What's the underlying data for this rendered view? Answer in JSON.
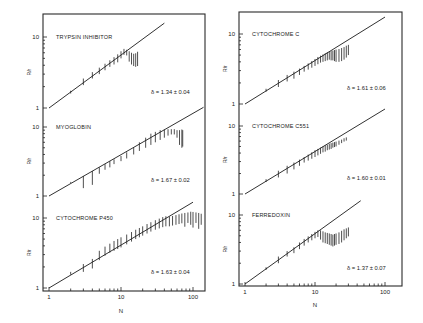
{
  "figure": {
    "x_axis_label": "N",
    "y_axis_label": "R/r",
    "x_tick_labels": [
      "1",
      "10",
      "100"
    ],
    "y_tick_labels": [
      "1",
      "10"
    ]
  },
  "chart_data": [
    {
      "type": "scatter",
      "title": "TRYPSIN INHIBITOR",
      "annotation": "δ = 1.34 ± 0.04",
      "delta": 1.34,
      "delta_err": 0.04,
      "xlabel": "N",
      "ylabel": "R/r",
      "xscale": "log",
      "yscale": "log",
      "xlim": [
        1,
        150
      ],
      "ylim": [
        1,
        20
      ],
      "fit_line": {
        "slope_exponent": 0.746,
        "x_range": [
          1,
          40
        ]
      },
      "error_bars": [
        {
          "n": 2,
          "lo": 1.6,
          "hi": 1.75
        },
        {
          "n": 3,
          "lo": 2.1,
          "hi": 2.6
        },
        {
          "n": 4,
          "lo": 2.6,
          "hi": 3.2
        },
        {
          "n": 5,
          "lo": 3.0,
          "hi": 3.7
        },
        {
          "n": 6,
          "lo": 3.4,
          "hi": 4.2
        },
        {
          "n": 7,
          "lo": 3.8,
          "hi": 4.7
        },
        {
          "n": 8,
          "lo": 4.1,
          "hi": 5.2
        },
        {
          "n": 9,
          "lo": 4.4,
          "hi": 5.7
        },
        {
          "n": 10,
          "lo": 5.0,
          "hi": 6.3
        },
        {
          "n": 11,
          "lo": 5.6,
          "hi": 6.8
        },
        {
          "n": 12,
          "lo": 5.5,
          "hi": 6.6
        },
        {
          "n": 13,
          "lo": 4.5,
          "hi": 6.3
        },
        {
          "n": 14,
          "lo": 4.1,
          "hi": 6.0
        },
        {
          "n": 15,
          "lo": 3.9,
          "hi": 5.8
        },
        {
          "n": 16,
          "lo": 3.8,
          "hi": 5.9
        },
        {
          "n": 17,
          "lo": 3.9,
          "hi": 6.2
        }
      ]
    },
    {
      "type": "scatter",
      "title": "MYOGLOBIN",
      "annotation": "δ = 1.67 ± 0.02",
      "delta": 1.67,
      "delta_err": 0.02,
      "xlabel": "N",
      "ylabel": "R/r",
      "xscale": "log",
      "yscale": "log",
      "xlim": [
        1,
        150
      ],
      "ylim": [
        1,
        20
      ],
      "fit_line": {
        "slope_exponent": 0.599,
        "x_range": [
          1,
          140
        ]
      },
      "error_bars": [
        {
          "n": 2,
          "lo": 1.55,
          "hi": 1.6
        },
        {
          "n": 3,
          "lo": 1.3,
          "hi": 1.95
        },
        {
          "n": 4,
          "lo": 1.45,
          "hi": 2.3
        },
        {
          "n": 5,
          "lo": 2.1,
          "hi": 2.6
        },
        {
          "n": 6,
          "lo": 2.4,
          "hi": 2.9
        },
        {
          "n": 7,
          "lo": 2.6,
          "hi": 3.2
        },
        {
          "n": 8,
          "lo": 2.9,
          "hi": 3.4
        },
        {
          "n": 10,
          "lo": 3.2,
          "hi": 3.8
        },
        {
          "n": 12,
          "lo": 3.5,
          "hi": 4.3
        },
        {
          "n": 15,
          "lo": 4.0,
          "hi": 5.0
        },
        {
          "n": 18,
          "lo": 4.5,
          "hi": 6.0
        },
        {
          "n": 22,
          "lo": 5.0,
          "hi": 7.0
        },
        {
          "n": 26,
          "lo": 5.5,
          "hi": 8.0
        },
        {
          "n": 30,
          "lo": 6.0,
          "hi": 8.5
        },
        {
          "n": 35,
          "lo": 6.5,
          "hi": 9.0
        },
        {
          "n": 40,
          "lo": 7.0,
          "hi": 9.2
        },
        {
          "n": 45,
          "lo": 7.5,
          "hi": 9.3
        },
        {
          "n": 50,
          "lo": 7.8,
          "hi": 9.3
        },
        {
          "n": 55,
          "lo": 7.8,
          "hi": 9.3
        },
        {
          "n": 60,
          "lo": 7.0,
          "hi": 9.0
        },
        {
          "n": 65,
          "lo": 5.5,
          "hi": 9.0
        },
        {
          "n": 70,
          "lo": 5.0,
          "hi": 9.2
        },
        {
          "n": 72,
          "lo": 5.2,
          "hi": 9.0
        }
      ]
    },
    {
      "type": "scatter",
      "title": "CYTOCHROME P450",
      "annotation": "δ = 1.63 ± 0.04",
      "delta": 1.63,
      "delta_err": 0.04,
      "xlabel": "N",
      "ylabel": "R/r",
      "xscale": "log",
      "yscale": "log",
      "xlim": [
        1,
        150
      ],
      "ylim": [
        1,
        20
      ],
      "fit_line": {
        "slope_exponent": 0.613,
        "x_range": [
          1,
          100
        ]
      },
      "error_bars": [
        {
          "n": 2,
          "lo": 1.55,
          "hi": 1.7
        },
        {
          "n": 3,
          "lo": 1.7,
          "hi": 2.2
        },
        {
          "n": 4,
          "lo": 1.9,
          "hi": 2.6
        },
        {
          "n": 5,
          "lo": 2.5,
          "hi": 3.4
        },
        {
          "n": 6,
          "lo": 2.9,
          "hi": 3.9
        },
        {
          "n": 7,
          "lo": 3.2,
          "hi": 4.3
        },
        {
          "n": 8,
          "lo": 3.4,
          "hi": 4.7
        },
        {
          "n": 9,
          "lo": 3.6,
          "hi": 5.0
        },
        {
          "n": 10,
          "lo": 3.8,
          "hi": 5.3
        },
        {
          "n": 12,
          "lo": 4.2,
          "hi": 5.8
        },
        {
          "n": 14,
          "lo": 4.6,
          "hi": 6.3
        },
        {
          "n": 16,
          "lo": 5.0,
          "hi": 6.8
        },
        {
          "n": 18,
          "lo": 5.3,
          "hi": 7.2
        },
        {
          "n": 20,
          "lo": 5.6,
          "hi": 7.6
        },
        {
          "n": 23,
          "lo": 6.0,
          "hi": 8.2
        },
        {
          "n": 26,
          "lo": 6.4,
          "hi": 8.7
        },
        {
          "n": 30,
          "lo": 6.8,
          "hi": 9.3
        },
        {
          "n": 34,
          "lo": 7.1,
          "hi": 9.8
        },
        {
          "n": 38,
          "lo": 7.4,
          "hi": 10.3
        },
        {
          "n": 42,
          "lo": 7.6,
          "hi": 10.6
        },
        {
          "n": 47,
          "lo": 7.6,
          "hi": 10.5
        },
        {
          "n": 52,
          "lo": 7.8,
          "hi": 10.7
        },
        {
          "n": 58,
          "lo": 8.0,
          "hi": 11.0
        },
        {
          "n": 64,
          "lo": 8.2,
          "hi": 11.3
        },
        {
          "n": 70,
          "lo": 8.4,
          "hi": 11.6
        },
        {
          "n": 77,
          "lo": 7.5,
          "hi": 11.8
        },
        {
          "n": 85,
          "lo": 8.5,
          "hi": 12.0
        },
        {
          "n": 93,
          "lo": 8.0,
          "hi": 12.3
        },
        {
          "n": 100,
          "lo": 7.3,
          "hi": 12.2
        },
        {
          "n": 110,
          "lo": 8.5,
          "hi": 12.0
        },
        {
          "n": 120,
          "lo": 7.0,
          "hi": 11.8
        },
        {
          "n": 130,
          "lo": 8.0,
          "hi": 11.5
        }
      ]
    },
    {
      "type": "scatter",
      "title": "CYTOCHROME C",
      "annotation": "δ = 1.61 ± 0.06",
      "delta": 1.61,
      "delta_err": 0.06,
      "xlabel": "N",
      "ylabel": "R/r",
      "xscale": "log",
      "yscale": "log",
      "xlim": [
        1,
        150
      ],
      "ylim": [
        1,
        20
      ],
      "fit_line": {
        "slope_exponent": 0.621,
        "x_range": [
          1,
          100
        ]
      },
      "error_bars": [
        {
          "n": 2,
          "lo": 1.5,
          "hi": 1.65
        },
        {
          "n": 3,
          "lo": 1.75,
          "hi": 2.2
        },
        {
          "n": 4,
          "lo": 2.1,
          "hi": 2.6
        },
        {
          "n": 5,
          "lo": 2.3,
          "hi": 2.9
        },
        {
          "n": 6,
          "lo": 2.6,
          "hi": 3.2
        },
        {
          "n": 7,
          "lo": 2.9,
          "hi": 3.5
        },
        {
          "n": 8,
          "lo": 3.1,
          "hi": 3.8
        },
        {
          "n": 9,
          "lo": 3.3,
          "hi": 4.1
        },
        {
          "n": 10,
          "lo": 3.5,
          "hi": 4.4
        },
        {
          "n": 11,
          "lo": 3.7,
          "hi": 4.7
        },
        {
          "n": 12,
          "lo": 3.9,
          "hi": 4.9
        },
        {
          "n": 13,
          "lo": 4.0,
          "hi": 5.1
        },
        {
          "n": 14,
          "lo": 4.1,
          "hi": 5.3
        },
        {
          "n": 15,
          "lo": 4.2,
          "hi": 5.5
        },
        {
          "n": 16,
          "lo": 4.3,
          "hi": 5.6
        },
        {
          "n": 17,
          "lo": 4.2,
          "hi": 5.7
        },
        {
          "n": 18,
          "lo": 4.2,
          "hi": 5.8
        },
        {
          "n": 19,
          "lo": 4.1,
          "hi": 5.9
        },
        {
          "n": 20,
          "lo": 4.0,
          "hi": 6.0
        },
        {
          "n": 22,
          "lo": 4.0,
          "hi": 6.1
        },
        {
          "n": 24,
          "lo": 4.1,
          "hi": 6.3
        },
        {
          "n": 26,
          "lo": 4.3,
          "hi": 6.5
        },
        {
          "n": 28,
          "lo": 4.6,
          "hi": 6.8
        },
        {
          "n": 30,
          "lo": 5.0,
          "hi": 7.0
        }
      ]
    },
    {
      "type": "scatter",
      "title": "CYTOCHROME C551",
      "annotation": "δ = 1.60 ± 0.01",
      "delta": 1.6,
      "delta_err": 0.01,
      "xlabel": "N",
      "ylabel": "R/r",
      "xscale": "log",
      "yscale": "log",
      "xlim": [
        1,
        150
      ],
      "ylim": [
        1,
        20
      ],
      "fit_line": {
        "slope_exponent": 0.625,
        "x_range": [
          1,
          100
        ]
      },
      "error_bars": [
        {
          "n": 2,
          "lo": 1.5,
          "hi": 1.65
        },
        {
          "n": 3,
          "lo": 1.75,
          "hi": 2.2
        },
        {
          "n": 4,
          "lo": 2.0,
          "hi": 2.6
        },
        {
          "n": 5,
          "lo": 2.3,
          "hi": 2.9
        },
        {
          "n": 6,
          "lo": 2.6,
          "hi": 3.2
        },
        {
          "n": 7,
          "lo": 2.9,
          "hi": 3.5
        },
        {
          "n": 8,
          "lo": 3.1,
          "hi": 3.8
        },
        {
          "n": 9,
          "lo": 3.3,
          "hi": 4.1
        },
        {
          "n": 10,
          "lo": 3.5,
          "hi": 4.4
        },
        {
          "n": 11,
          "lo": 3.7,
          "hi": 4.6
        },
        {
          "n": 12,
          "lo": 3.9,
          "hi": 4.8
        },
        {
          "n": 13,
          "lo": 4.1,
          "hi": 5.0
        },
        {
          "n": 14,
          "lo": 4.2,
          "hi": 5.2
        },
        {
          "n": 15,
          "lo": 4.4,
          "hi": 5.3
        },
        {
          "n": 16,
          "lo": 4.5,
          "hi": 5.5
        },
        {
          "n": 17,
          "lo": 4.6,
          "hi": 5.6
        },
        {
          "n": 18,
          "lo": 4.8,
          "hi": 5.7
        },
        {
          "n": 19,
          "lo": 4.9,
          "hi": 5.8
        },
        {
          "n": 20,
          "lo": 5.0,
          "hi": 5.9
        },
        {
          "n": 22,
          "lo": 5.3,
          "hi": 6.1
        },
        {
          "n": 24,
          "lo": 5.6,
          "hi": 6.3
        },
        {
          "n": 26,
          "lo": 5.9,
          "hi": 6.6
        },
        {
          "n": 28,
          "lo": 6.1,
          "hi": 6.8
        }
      ]
    },
    {
      "type": "scatter",
      "title": "FERREDOXIN",
      "annotation": "δ = 1.37 ± 0.07",
      "delta": 1.37,
      "delta_err": 0.07,
      "xlabel": "N",
      "ylabel": "R/r",
      "xscale": "log",
      "yscale": "log",
      "xlim": [
        1,
        150
      ],
      "ylim": [
        1,
        20
      ],
      "fit_line": {
        "slope_exponent": 0.73,
        "x_range": [
          1,
          45
        ]
      },
      "error_bars": [
        {
          "n": 2,
          "lo": 1.6,
          "hi": 1.75
        },
        {
          "n": 3,
          "lo": 2.0,
          "hi": 2.5
        },
        {
          "n": 4,
          "lo": 2.5,
          "hi": 3.0
        },
        {
          "n": 5,
          "lo": 2.8,
          "hi": 3.4
        },
        {
          "n": 6,
          "lo": 3.2,
          "hi": 4.0
        },
        {
          "n": 7,
          "lo": 3.6,
          "hi": 4.5
        },
        {
          "n": 8,
          "lo": 4.0,
          "hi": 4.9
        },
        {
          "n": 9,
          "lo": 4.3,
          "hi": 5.3
        },
        {
          "n": 10,
          "lo": 4.6,
          "hi": 5.7
        },
        {
          "n": 11,
          "lo": 4.8,
          "hi": 6.0
        },
        {
          "n": 12,
          "lo": 4.4,
          "hi": 6.0
        },
        {
          "n": 13,
          "lo": 4.0,
          "hi": 5.8
        },
        {
          "n": 14,
          "lo": 3.9,
          "hi": 5.6
        },
        {
          "n": 15,
          "lo": 3.8,
          "hi": 5.5
        },
        {
          "n": 16,
          "lo": 3.7,
          "hi": 5.4
        },
        {
          "n": 17,
          "lo": 3.6,
          "hi": 5.3
        },
        {
          "n": 18,
          "lo": 3.5,
          "hi": 5.2
        },
        {
          "n": 19,
          "lo": 3.6,
          "hi": 5.3
        },
        {
          "n": 20,
          "lo": 3.7,
          "hi": 5.4
        },
        {
          "n": 22,
          "lo": 3.8,
          "hi": 5.6
        },
        {
          "n": 24,
          "lo": 4.0,
          "hi": 5.9
        },
        {
          "n": 26,
          "lo": 4.3,
          "hi": 6.2
        },
        {
          "n": 28,
          "lo": 4.6,
          "hi": 6.4
        },
        {
          "n": 30,
          "lo": 4.9,
          "hi": 6.6
        }
      ]
    }
  ],
  "layout": {
    "columns": [
      {
        "frame": {
          "x0": 43,
          "x1": 205,
          "y0": 14,
          "y1": 291
        },
        "x_px_at_1": 49,
        "px_per_decade_x": 72,
        "panels": [
          {
            "index": 0,
            "y_px_at_1": 108,
            "px_per_decade_y": 71
          },
          {
            "index": 1,
            "y_px_at_1": 196,
            "px_per_decade_y": 69
          },
          {
            "index": 2,
            "y_px_at_1": 288,
            "px_per_decade_y": 70
          }
        ],
        "xlabel_y": 313
      },
      {
        "frame": {
          "x0": 239,
          "x1": 402,
          "y0": 12,
          "y1": 286
        },
        "x_px_at_1": 245,
        "px_per_decade_x": 70,
        "panels": [
          {
            "index": 3,
            "y_px_at_1": 104,
            "px_per_decade_y": 70
          },
          {
            "index": 4,
            "y_px_at_1": 194,
            "px_per_decade_y": 68
          },
          {
            "index": 5,
            "y_px_at_1": 284,
            "px_per_decade_y": 69
          }
        ],
        "xlabel_y": 307
      }
    ]
  }
}
